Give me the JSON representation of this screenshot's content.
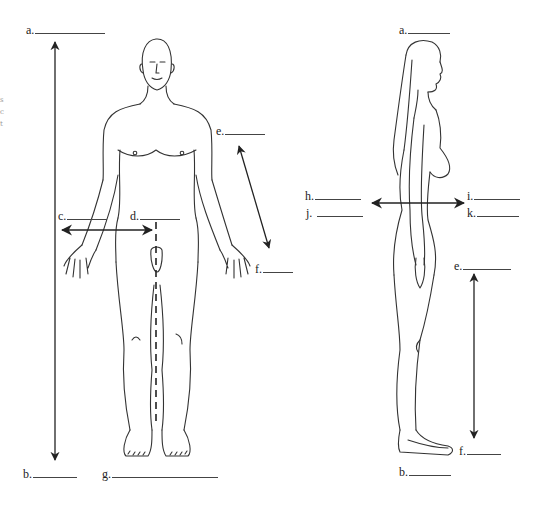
{
  "diagram": {
    "title": "",
    "edge_marks": [
      "s",
      "c",
      "t"
    ],
    "figures": [
      {
        "name": "male-anterior",
        "view": "anterior",
        "labels": [
          {
            "key": "a",
            "text": "a.",
            "blank_px": 70,
            "x": 26,
            "y": 22
          },
          {
            "key": "b",
            "text": "b.",
            "blank_px": 44,
            "x": 23,
            "y": 467
          },
          {
            "key": "c",
            "text": "c.",
            "blank_px": 40,
            "x": 58,
            "y": 209
          },
          {
            "key": "d",
            "text": "d.",
            "blank_px": 40,
            "x": 129,
            "y": 209
          },
          {
            "key": "e",
            "text": "e.",
            "blank_px": 40,
            "x": 215,
            "y": 124
          },
          {
            "key": "f",
            "text": "f.",
            "blank_px": 30,
            "x": 255,
            "y": 262
          },
          {
            "key": "g",
            "text": "g.",
            "blank_px": 106,
            "x": 102,
            "y": 467
          }
        ],
        "arrows": [
          {
            "name": "height-arrow",
            "x1": 55,
            "y1": 40,
            "x2": 55,
            "y2": 462,
            "heads": "both"
          },
          {
            "name": "lateral-medial-arrow",
            "x1": 60,
            "y1": 230,
            "x2": 153,
            "y2": 230,
            "heads": "both"
          },
          {
            "name": "proximal-distal-arrow",
            "x1": 238,
            "y1": 143,
            "x2": 270,
            "y2": 250,
            "heads": "both"
          }
        ],
        "midline": {
          "x": 156,
          "y1": 222,
          "y2": 425,
          "style": "dashed"
        }
      },
      {
        "name": "female-lateral",
        "view": "lateral",
        "labels": [
          {
            "key": "a",
            "text": "a.",
            "blank_px": 42,
            "x": 399,
            "y": 22
          },
          {
            "key": "b",
            "text": "b.",
            "blank_px": 42,
            "x": 399,
            "y": 465
          },
          {
            "key": "h",
            "text": "h.",
            "blank_px": 46,
            "x": 305,
            "y": 189
          },
          {
            "key": "j",
            "text": "j.",
            "blank_px": 46,
            "x": 305,
            "y": 206
          },
          {
            "key": "i",
            "text": "i.",
            "blank_px": 46,
            "x": 467,
            "y": 189
          },
          {
            "key": "k",
            "text": "k.",
            "blank_px": 42,
            "x": 467,
            "y": 206
          },
          {
            "key": "e",
            "text": "e.",
            "blank_px": 48,
            "x": 453,
            "y": 259
          },
          {
            "key": "f",
            "text": "f.",
            "blank_px": 34,
            "x": 458,
            "y": 444
          }
        ],
        "arrows": [
          {
            "name": "anterior-posterior-arrow",
            "x1": 370,
            "y1": 203,
            "x2": 465,
            "y2": 203,
            "heads": "both"
          },
          {
            "name": "superior-inferior-arrow",
            "x1": 474,
            "y1": 272,
            "x2": 474,
            "y2": 440,
            "heads": "both"
          }
        ]
      }
    ],
    "colors": {
      "ink": "#222222",
      "blank_line": "#444444",
      "background": "#ffffff"
    }
  }
}
